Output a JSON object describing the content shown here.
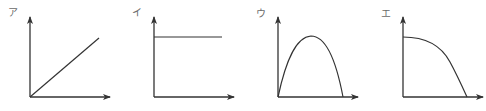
{
  "figure": {
    "panels": [
      {
        "label": "ア",
        "shape": "linear increasing from origin"
      },
      {
        "label": "イ",
        "shape": "constant horizontal line"
      },
      {
        "label": "ウ",
        "shape": "parabola rising then falling to zero"
      },
      {
        "label": "エ",
        "shape": "decreasing concave-down curve to zero"
      }
    ],
    "colors": {
      "line": "#333333",
      "label": "#6a6a6a",
      "background": "#ffffff"
    }
  }
}
